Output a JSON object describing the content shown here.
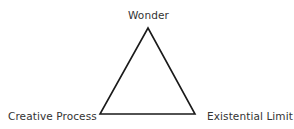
{
  "diagram": {
    "type": "triangle",
    "vertices": {
      "top": "Wonder",
      "bottom_left": "Creative Process",
      "bottom_right": "Existential Limit"
    },
    "stroke_color": "#1a1a1a",
    "text_color": "#333333"
  }
}
